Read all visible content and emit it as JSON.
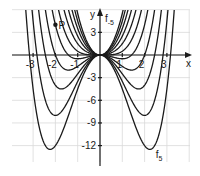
{
  "chart_data": {
    "type": "line",
    "title": "",
    "function_family": "f_t(x) = 0.5*x^4 - t*x^2",
    "parameters_t": [
      -5,
      -4,
      -3,
      -2,
      -1,
      0,
      1,
      2,
      3,
      4,
      5
    ],
    "xlabel": "x",
    "ylabel": "y",
    "xlim": [
      -4,
      4
    ],
    "ylim": [
      -14.5,
      6
    ],
    "x_ticks": [
      -3,
      -2,
      -1,
      1,
      2,
      3
    ],
    "x_tick_labels": [
      "-3",
      "-2",
      "-1",
      "1",
      "2",
      "3"
    ],
    "y_ticks": [
      3,
      -3,
      -6,
      -9,
      -12
    ],
    "y_tick_labels": [
      "3",
      "-3",
      "-6",
      "-9",
      "-12"
    ],
    "grid": true,
    "grid_x_step": 1,
    "grid_y_step": 3,
    "curve_labels": [
      {
        "text": "f",
        "sub": "-5",
        "t": -5
      },
      {
        "text": "f",
        "sub": "5",
        "t": 5
      }
    ],
    "points": [
      {
        "label": "P",
        "x": -2,
        "y": 4
      }
    ],
    "minima_observed": [
      {
        "t": 5,
        "x": 2.24,
        "y": -12.5
      },
      {
        "t": 4,
        "x": 2.0,
        "y": -8
      },
      {
        "t": 3,
        "x": 1.73,
        "y": -4.5
      },
      {
        "t": 2,
        "x": 1.41,
        "y": -2
      },
      {
        "t": 1,
        "x": 1.0,
        "y": -0.5
      }
    ]
  }
}
